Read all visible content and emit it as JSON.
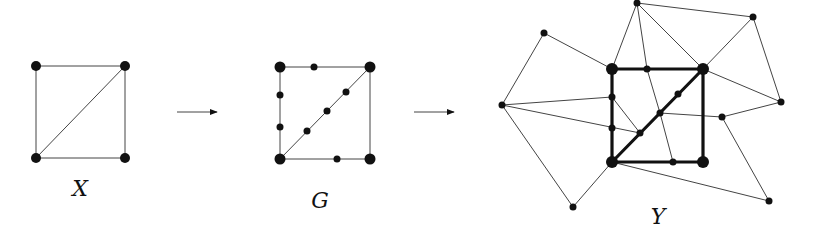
{
  "diagram": {
    "labels": {
      "x": "X",
      "g": "G",
      "y": "Y"
    },
    "colors": {
      "ink": "#111111",
      "thin_edge": "#444444",
      "background": "#ffffff"
    },
    "panels": [
      {
        "name": "X",
        "description": "square with one diagonal (4 vertices, 5 edges)"
      },
      {
        "name": "G",
        "description": "subdivision of X with 8 extra vertices"
      },
      {
        "name": "Y",
        "description": "graph containing G (bold) as subgraph plus 8 outer vertices"
      }
    ],
    "arrows": [
      {
        "from": "X",
        "to": "G"
      },
      {
        "from": "G",
        "to": "Y"
      }
    ]
  }
}
